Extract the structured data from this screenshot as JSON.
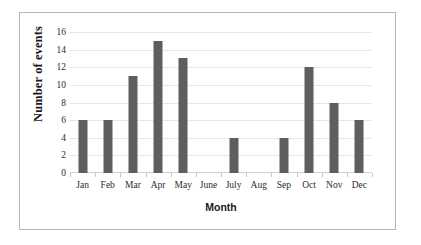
{
  "chart_data": {
    "type": "bar",
    "title": "",
    "subtitle": "",
    "xlabel": "Month",
    "ylabel": "Number of events",
    "categories": [
      "Jan",
      "Feb",
      "Mar",
      "Apr",
      "May",
      "June",
      "July",
      "Aug",
      "Sep",
      "Oct",
      "Nov",
      "Dec"
    ],
    "values": [
      6,
      6,
      11,
      15,
      13,
      0,
      4,
      0,
      4,
      12,
      8,
      6
    ],
    "series": [
      {
        "name": "Number of events",
        "values": [
          6,
          6,
          11,
          15,
          13,
          0,
          4,
          0,
          4,
          12,
          8,
          6
        ]
      }
    ],
    "ylim": [
      0,
      16
    ],
    "ytick_labels": [
      "0",
      "2",
      "4",
      "6",
      "8",
      "10",
      "12",
      "14",
      "16"
    ],
    "ytick_values": [
      0,
      2,
      4,
      6,
      8,
      10,
      12,
      14,
      16
    ],
    "grid": "horizontal",
    "legend": "none",
    "bar_color": "#5e5e5e",
    "gridline_color": "#e6e6e6",
    "axis_color": "#c9c9c9",
    "plot_background": "#ffffff",
    "border_color": "#b7b7b7"
  }
}
